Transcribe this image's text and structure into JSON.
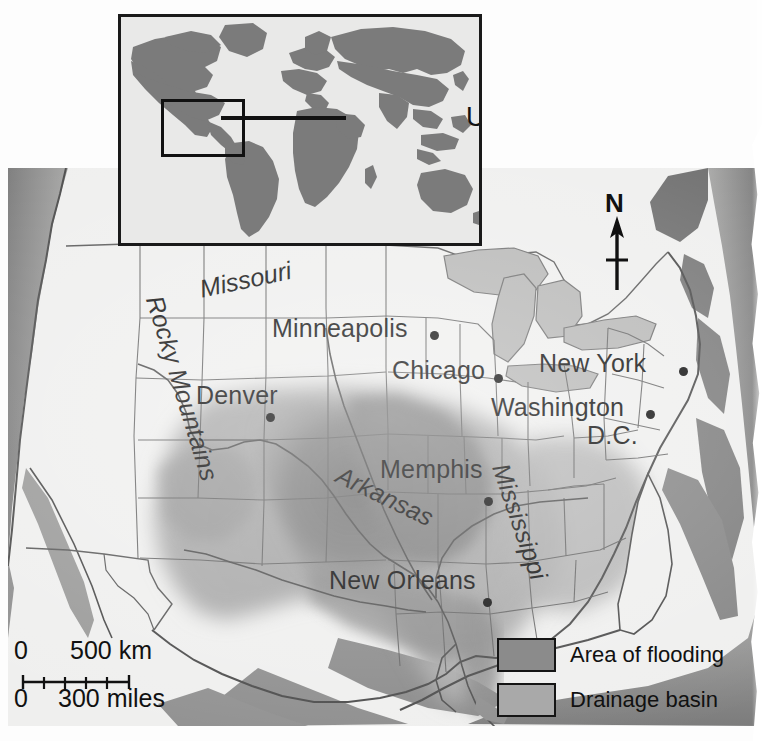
{
  "map": {
    "title": "USA Mississippi flooding map",
    "region": "USA",
    "inset": {
      "label": "USA",
      "locator_box": "United States",
      "type": "world-locator-map"
    },
    "compass": {
      "north_label": "N"
    },
    "scale": {
      "km_zero": "0",
      "km_value": "500 km",
      "miles_zero": "0",
      "miles_value": "300 miles",
      "tick_segments": 5
    },
    "legend": {
      "items": [
        {
          "label": "Area of flooding",
          "color": "#8b8b8b"
        },
        {
          "label": "Drainage basin",
          "color": "#a9a9a9"
        }
      ]
    },
    "cities": [
      {
        "name": "Minneapolis",
        "x": 272,
        "y": 322,
        "dot_x": 430,
        "dot_y": 331
      },
      {
        "name": "Chicago",
        "x": 392,
        "y": 364,
        "dot_x": 494,
        "dot_y": 374
      },
      {
        "name": "New York",
        "x": 539,
        "y": 357,
        "dot_x": 679,
        "dot_y": 367
      },
      {
        "name": "Denver",
        "x": 196,
        "y": 389,
        "dot_x": 266,
        "dot_y": 413
      },
      {
        "name": "Washington",
        "x": 491,
        "y": 401,
        "dot_x": 646,
        "dot_y": 410
      },
      {
        "name": "D.C.",
        "x": 587,
        "y": 429,
        "dot_x": null,
        "dot_y": null
      },
      {
        "name": "Memphis",
        "x": 380,
        "y": 463,
        "dot_x": 484,
        "dot_y": 497
      },
      {
        "name": "New Orleans",
        "x": 329,
        "y": 574,
        "dot_x": 483,
        "dot_y": 598
      }
    ],
    "features": [
      {
        "name": "Missouri",
        "type": "river",
        "x": 192,
        "y": 275,
        "rotate": -12
      },
      {
        "name": "Arkansas",
        "type": "river",
        "x": 330,
        "y": 459,
        "rotate": 26
      },
      {
        "name": "Mississippi",
        "type": "river",
        "x": 492,
        "y": 450,
        "rotate": 71
      },
      {
        "name": "Rocky Mountains",
        "type": "mountains",
        "x": 146,
        "y": 282,
        "rotate": 73
      }
    ],
    "colors": {
      "land": "#efefee",
      "ocean": "#8d8d8d",
      "drainage_basin": "#a9a9a9",
      "flood_area": "#858585",
      "lakes": "#b5b5b4",
      "borders": "#5d5d5d",
      "text": "#111111"
    }
  }
}
